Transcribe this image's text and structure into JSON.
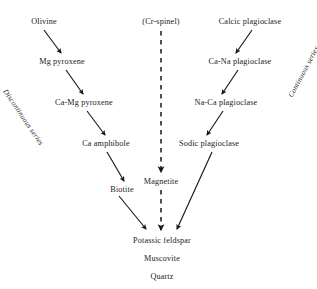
{
  "diagram": {
    "background_color": "#ffffff",
    "text_color": "#1b1b1b",
    "nodes": [
      {
        "id": "olivine",
        "label": "Olivine",
        "x": 44,
        "y": 22
      },
      {
        "id": "mg-pyroxene",
        "label": "Mg pyroxene",
        "x": 62,
        "y": 62
      },
      {
        "id": "ca-mg-pyroxene",
        "label": "Ca-Mg pyroxene",
        "x": 84,
        "y": 103
      },
      {
        "id": "ca-amphibole",
        "label": "Ca amphibole",
        "x": 106,
        "y": 144
      },
      {
        "id": "biotite",
        "label": "Biotite",
        "x": 122,
        "y": 190
      },
      {
        "id": "cr-spinel",
        "label": "(Cr-spinel)",
        "x": 161,
        "y": 22
      },
      {
        "id": "magnetite",
        "label": "Magnetite",
        "x": 161,
        "y": 182
      },
      {
        "id": "calcic-plagioclase",
        "label": "Calcic plagioclase",
        "x": 250,
        "y": 22
      },
      {
        "id": "ca-na-plagioclase",
        "label": "Ca-Na plagioclase",
        "x": 240,
        "y": 62
      },
      {
        "id": "na-ca-plagioclase",
        "label": "Na-Ca plagioclase",
        "x": 226,
        "y": 103
      },
      {
        "id": "sodic-plagioclase",
        "label": "Sodic plagioclase",
        "x": 209,
        "y": 144
      },
      {
        "id": "potassic-feldspar",
        "label": "Potassic feldspar",
        "x": 162,
        "y": 241
      },
      {
        "id": "muscovite",
        "label": "Muscovite",
        "x": 162,
        "y": 259
      },
      {
        "id": "quartz",
        "label": "Quartz",
        "x": 162,
        "y": 277
      }
    ],
    "series_labels": [
      {
        "id": "discontinuous",
        "label": "Discontinuous series"
      },
      {
        "id": "continuous",
        "label": "Continuous series"
      }
    ],
    "arrows": [
      {
        "id": "olivine-to-mg-pyroxene",
        "x1": 44,
        "y1": 30,
        "x2": 61,
        "y2": 53,
        "style": "solid"
      },
      {
        "id": "mg-pyroxene-to-ca-mg-pyroxene",
        "x1": 66,
        "y1": 70,
        "x2": 83,
        "y2": 94,
        "style": "solid"
      },
      {
        "id": "ca-mg-pyroxene-to-ca-amphibole",
        "x1": 87,
        "y1": 111,
        "x2": 105,
        "y2": 135,
        "style": "solid"
      },
      {
        "id": "ca-amphibole-to-biotite",
        "x1": 107,
        "y1": 152,
        "x2": 124,
        "y2": 181,
        "style": "solid"
      },
      {
        "id": "biotite-to-potassic-feldspar",
        "x1": 119,
        "y1": 196,
        "x2": 146,
        "y2": 229,
        "style": "solid"
      },
      {
        "id": "cr-spinel-to-magnetite",
        "x1": 161,
        "y1": 31,
        "x2": 161,
        "y2": 172,
        "style": "dashed"
      },
      {
        "id": "magnetite-to-potassic-feldspar",
        "x1": 161,
        "y1": 190,
        "x2": 161,
        "y2": 230,
        "style": "dashed"
      },
      {
        "id": "calcic-to-ca-na-plagioclase",
        "x1": 252,
        "y1": 30,
        "x2": 236,
        "y2": 53,
        "style": "solid"
      },
      {
        "id": "ca-na-to-na-ca-plagioclase",
        "x1": 238,
        "y1": 70,
        "x2": 222,
        "y2": 94,
        "style": "solid"
      },
      {
        "id": "na-ca-to-sodic-plagioclase",
        "x1": 223,
        "y1": 111,
        "x2": 207,
        "y2": 135,
        "style": "solid"
      },
      {
        "id": "sodic-plagioclase-to-potassic-feldspar",
        "x1": 212,
        "y1": 152,
        "x2": 177,
        "y2": 229,
        "style": "solid"
      }
    ]
  }
}
